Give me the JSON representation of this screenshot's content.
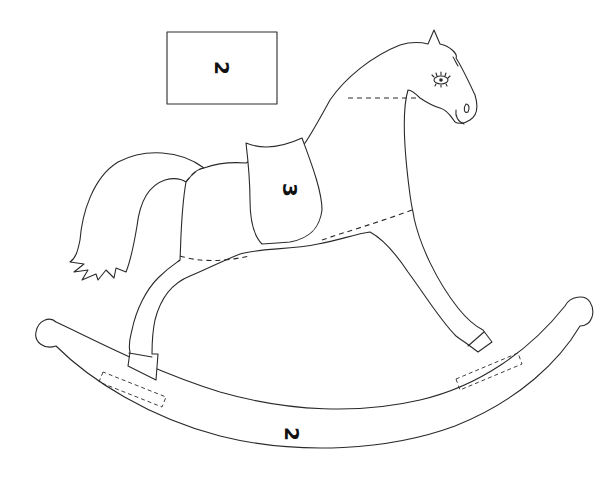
{
  "figure": {
    "pieces": {
      "swatch": {
        "label": "2"
      },
      "saddle": {
        "label": "3"
      },
      "rocker": {
        "label": "2"
      }
    },
    "colors": {
      "line": "#2a2a2a",
      "background": "#ffffff",
      "label": "#111111"
    }
  }
}
